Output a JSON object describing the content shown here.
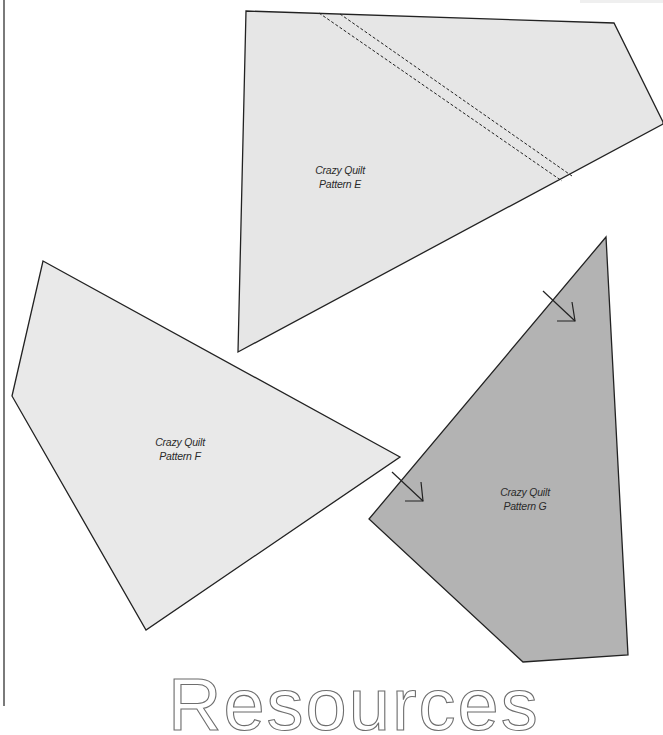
{
  "colors": {
    "light_piece_fill": "#e6e6e6",
    "dark_piece_fill": "#b3b3b3",
    "outline": "#222222",
    "heading": "#6e6e6e"
  },
  "pieces": [
    {
      "label_line1": "Crazy Quilt",
      "label_line2": "Pattern E",
      "fill": "light"
    },
    {
      "label_line1": "Crazy Quilt",
      "label_line2": "Pattern F",
      "fill": "light"
    },
    {
      "label_line1": "Crazy Quilt",
      "label_line2": "Pattern G",
      "fill": "dark"
    }
  ],
  "footer": {
    "heading": "Resources"
  }
}
